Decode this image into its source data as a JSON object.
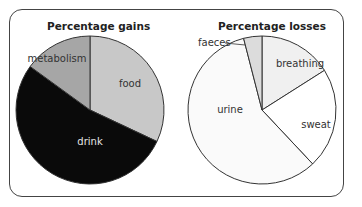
{
  "chart_data": [
    {
      "type": "pie",
      "title": "Percentage gains",
      "categories": [
        "food",
        "drink",
        "metabolism"
      ],
      "values": [
        32,
        53,
        15
      ],
      "colors": [
        "#c8c8c8",
        "#0a0a0a",
        "#a6a6a6"
      ],
      "label_colors": [
        "#333333",
        "#e6e6e6",
        "#333333"
      ]
    },
    {
      "type": "pie",
      "title": "Percentage losses",
      "categories": [
        "breathing",
        "sweat",
        "urine",
        "faeces"
      ],
      "values": [
        16,
        22,
        58,
        4
      ],
      "colors": [
        "#f0f0f0",
        "#ffffff",
        "#fafafa",
        "#dcdcdc"
      ],
      "label_colors": [
        "#333333",
        "#333333",
        "#333333",
        "#333333"
      ]
    }
  ],
  "left": {
    "title": "Percentage gains"
  },
  "right": {
    "title": "Percentage losses"
  }
}
